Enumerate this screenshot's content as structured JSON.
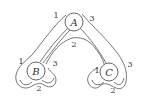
{
  "diagram": {
    "type": "node-link",
    "nodes": [
      {
        "id": "A",
        "label": "A",
        "cx": 74,
        "cy": 22,
        "r": 9,
        "ports": [
          {
            "label": "1",
            "x": 56,
            "y": 18
          },
          {
            "label": "3",
            "x": 91,
            "y": 20
          },
          {
            "label": "2",
            "x": 72,
            "y": 47
          }
        ]
      },
      {
        "id": "B",
        "label": "B",
        "cx": 36,
        "cy": 71,
        "r": 9,
        "ports": [
          {
            "label": "1",
            "x": 20,
            "y": 64
          },
          {
            "label": "3",
            "x": 53,
            "y": 66
          },
          {
            "label": "2",
            "x": 37,
            "y": 91
          }
        ]
      },
      {
        "id": "C",
        "label": "C",
        "cx": 109,
        "cy": 72,
        "r": 9,
        "ports": [
          {
            "label": "1",
            "x": 95,
            "y": 73
          },
          {
            "label": "3",
            "x": 128,
            "y": 67
          },
          {
            "label": "2",
            "x": 111,
            "y": 93
          }
        ]
      }
    ],
    "edges": [
      {
        "from": "A",
        "to": "B"
      },
      {
        "from": "A",
        "to": "C"
      }
    ]
  }
}
